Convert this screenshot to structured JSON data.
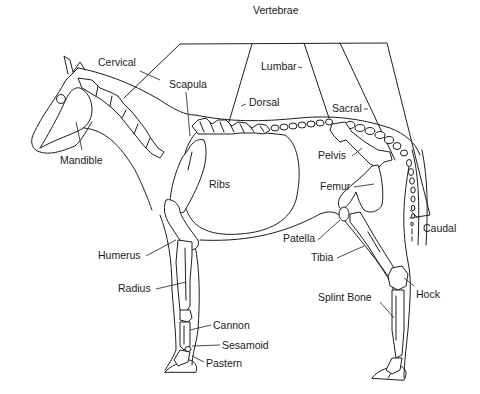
{
  "diagram": {
    "stroke_color": "#1e1e1e",
    "background": "#ffffff",
    "bracket_label": "Vertebrae",
    "labels": [
      {
        "id": "vertebrae",
        "text": "Vertebrae",
        "x": 253,
        "y": 5
      },
      {
        "id": "cervical",
        "text": "Cervical",
        "x": 98,
        "y": 57
      },
      {
        "id": "scapula",
        "text": "Scapula",
        "x": 169,
        "y": 79
      },
      {
        "id": "lumbar",
        "text": "Lumbar",
        "x": 261,
        "y": 61
      },
      {
        "id": "dorsal",
        "text": "Dorsal",
        "x": 249,
        "y": 97
      },
      {
        "id": "sacral",
        "text": "Sacral",
        "x": 332,
        "y": 103
      },
      {
        "id": "mandible",
        "text": "Mandible",
        "x": 60,
        "y": 155
      },
      {
        "id": "pelvis",
        "text": "Pelvis",
        "x": 318,
        "y": 150
      },
      {
        "id": "ribs",
        "text": "Ribs",
        "x": 209,
        "y": 179
      },
      {
        "id": "femur",
        "text": "Femur",
        "x": 320,
        "y": 181
      },
      {
        "id": "caudal",
        "text": "Caudal",
        "x": 423,
        "y": 223
      },
      {
        "id": "patella",
        "text": "Patella",
        "x": 283,
        "y": 233
      },
      {
        "id": "humerus",
        "text": "Humerus",
        "x": 98,
        "y": 250
      },
      {
        "id": "tibia",
        "text": "Tibia",
        "x": 311,
        "y": 252
      },
      {
        "id": "radius",
        "text": "Radius",
        "x": 118,
        "y": 283
      },
      {
        "id": "hock",
        "text": "Hock",
        "x": 416,
        "y": 289
      },
      {
        "id": "splint_bone",
        "text": "Splint Bone",
        "x": 318,
        "y": 292
      },
      {
        "id": "cannon",
        "text": "Cannon",
        "x": 213,
        "y": 320
      },
      {
        "id": "sesamoid",
        "text": "Sesamoid",
        "x": 222,
        "y": 340
      },
      {
        "id": "pastern",
        "text": "Pastern",
        "x": 206,
        "y": 358
      }
    ]
  }
}
